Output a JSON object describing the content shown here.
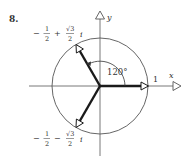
{
  "problem": {
    "number": "8."
  },
  "axes": {
    "x_label": "x",
    "y_label": "y"
  },
  "unit_label": "1",
  "angle_label": "120°",
  "roots": [
    {
      "name": "root-1",
      "real": "1",
      "angle_deg": 0
    },
    {
      "name": "root-2",
      "real_sign": "−",
      "real_num": "1",
      "real_den": "2",
      "imag_sign": "+",
      "imag_num": "√3",
      "imag_den": "2",
      "imag_unit": "i",
      "angle_deg": 120
    },
    {
      "name": "root-3",
      "real_sign": "−",
      "real_num": "1",
      "real_den": "2",
      "imag_sign": "−",
      "imag_num": "√3",
      "imag_den": "2",
      "imag_unit": "i",
      "angle_deg": 240
    }
  ],
  "colors": {
    "line": "#555555",
    "vector": "#1a1a1a",
    "text": "#333333"
  }
}
